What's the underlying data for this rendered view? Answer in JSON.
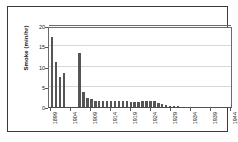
{
  "chart_data": {
    "type": "bar",
    "title": "",
    "xlabel": "",
    "ylabel": "Smoke (min/hr)",
    "ylim": [
      0,
      20
    ],
    "yticks": [
      0,
      5,
      10,
      15,
      20
    ],
    "ytick_labels": [
      "0",
      "5",
      "10",
      "15",
      "20"
    ],
    "grid": true,
    "grid_axis": "y",
    "legend": "none",
    "bar_color": "#555555",
    "categories": [
      1899,
      1900,
      1901,
      1902,
      1903,
      1904,
      1905,
      1906,
      1907,
      1908,
      1909,
      1910,
      1911,
      1912,
      1913,
      1914,
      1915,
      1916,
      1917,
      1918,
      1919,
      1920,
      1921,
      1922,
      1923,
      1924,
      1925,
      1926,
      1927,
      1928,
      1929,
      1930,
      1931,
      1932,
      1933,
      1934,
      1935,
      1936,
      1937,
      1938,
      1939,
      1940,
      1941,
      1942,
      1943,
      1944
    ],
    "xtick_labels": [
      "1899",
      "1904",
      "1909",
      "1914",
      "1919",
      "1924",
      "1929",
      "1934",
      "1939",
      "1944"
    ],
    "xtick_indices": [
      0,
      5,
      10,
      15,
      20,
      25,
      30,
      35,
      40,
      45
    ],
    "values": [
      17.3,
      11.0,
      7.5,
      8.4,
      0.0,
      0.0,
      0.0,
      13.3,
      3.8,
      2.2,
      1.9,
      1.5,
      1.4,
      1.5,
      1.4,
      1.5,
      1.5,
      1.5,
      1.6,
      1.6,
      1.3,
      1.2,
      1.2,
      1.5,
      1.6,
      1.5,
      1.4,
      1.1,
      0.8,
      0.5,
      0.35,
      0.2,
      0.15,
      0.12,
      0.1,
      0.1,
      0.1,
      0.1,
      0.1,
      0.1,
      0.1,
      0.1,
      0.1,
      0.1,
      0.1,
      0.1
    ]
  }
}
